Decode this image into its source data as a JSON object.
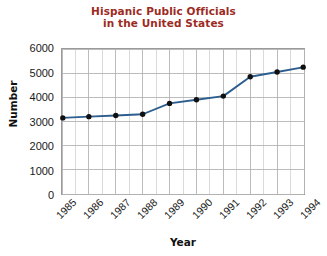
{
  "chart_data": {
    "type": "line",
    "title": "Hispanic Public Officials in the United States",
    "title_lines": [
      "Hispanic Public Officials",
      "in the United States"
    ],
    "xlabel": "Year",
    "ylabel": "Number",
    "categories": [
      "1985",
      "1986",
      "1987",
      "1988",
      "1989",
      "1990",
      "1991",
      "1992",
      "1993",
      "1994"
    ],
    "values": [
      3150,
      3200,
      3250,
      3300,
      3750,
      3900,
      4050,
      4850,
      5050,
      5250
    ],
    "series": [
      {
        "name": "Hispanic Public Officials",
        "values": [
          3150,
          3200,
          3250,
          3300,
          3750,
          3900,
          4050,
          4850,
          5050,
          5250
        ]
      }
    ],
    "ylim": [
      0,
      6000
    ],
    "yticks": [
      0,
      1000,
      2000,
      3000,
      4000,
      5000,
      6000
    ],
    "ytick_labels": [
      "0",
      "1000",
      "2000",
      "3000",
      "4000",
      "5000",
      "6000"
    ],
    "grid": true,
    "minor_grid": true,
    "legend": "none",
    "line_color": "#2d5e8e",
    "marker_color": "#101010",
    "title_color": "#9d2b1f",
    "grid_color": "#b4b4b4",
    "frame_color": "#9a9a9a"
  }
}
